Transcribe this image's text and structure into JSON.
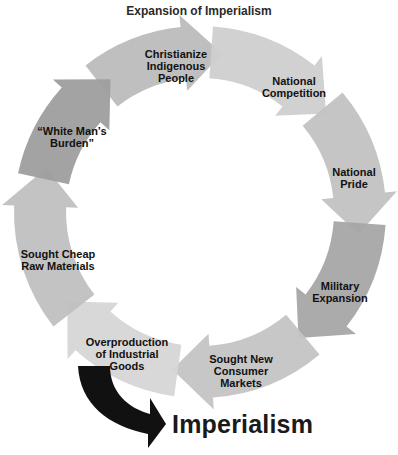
{
  "title": "Expansion of Imperialism",
  "cycle": {
    "center": [
      200,
      212
    ],
    "outer_radius": 186,
    "inner_radius": 134,
    "direction": "clockwise",
    "steps": [
      {
        "label": "Christianize\nIndigenous\nPeople",
        "start_deg": -128,
        "end_deg": -82,
        "color": "#bcbcbc",
        "label_pos": [
          176,
          66
        ]
      },
      {
        "label": "National\nCompetition",
        "start_deg": -86,
        "end_deg": -38,
        "color": "#cfcfcf",
        "label_pos": [
          294,
          87
        ]
      },
      {
        "label": "National\nPride",
        "start_deg": -40,
        "end_deg": 8,
        "color": "#c2c2c2",
        "label_pos": [
          354,
          178
        ]
      },
      {
        "label": "Military\nExpansion",
        "start_deg": 4,
        "end_deg": 52,
        "color": "#a6a6a6",
        "label_pos": [
          340,
          292
        ]
      },
      {
        "label": "Sought New\nConsumer\nMarkets",
        "start_deg": 50,
        "end_deg": 100,
        "color": "#c4c4c4",
        "label_pos": [
          241,
          371
        ]
      },
      {
        "label": "Overproduction\nof Industrial\nGoods",
        "start_deg": 98,
        "end_deg": 146,
        "color": "#d6d6d6",
        "label_pos": [
          127,
          354
        ]
      },
      {
        "label": "Sought Cheap\nRaw Materials",
        "start_deg": 142,
        "end_deg": 196,
        "color": "#c0c0c0",
        "label_pos": [
          58,
          260
        ]
      },
      {
        "label": "“White Man’s\nBurden”",
        "start_deg": 192,
        "end_deg": 236,
        "color": "#9e9e9e",
        "label_pos": [
          72,
          137
        ]
      }
    ]
  },
  "outcome": {
    "label": "Imperialism",
    "arrow_color": "#111111"
  }
}
